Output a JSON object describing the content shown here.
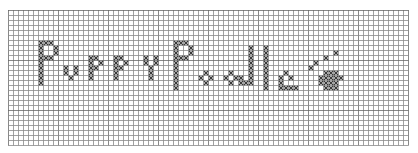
{
  "pattern": {
    "title": "Puppy Puddle",
    "cols": 80,
    "rows": 27,
    "cell_px": 5,
    "grid_color": "#8a8a8a",
    "grid_major_color": "#6a6a6a",
    "stitch_color": "#3a3a3a",
    "stitch_symbol": "x",
    "stitches": [
      [
        6,
        6
      ],
      [
        7,
        6
      ],
      [
        8,
        6
      ],
      [
        9,
        7
      ],
      [
        9,
        8
      ],
      [
        7,
        9
      ],
      [
        8,
        9
      ],
      [
        6,
        7
      ],
      [
        6,
        8
      ],
      [
        6,
        9
      ],
      [
        6,
        10
      ],
      [
        6,
        11
      ],
      [
        6,
        12
      ],
      [
        6,
        13
      ],
      [
        6,
        14
      ],
      [
        11,
        11
      ],
      [
        13,
        11
      ],
      [
        11,
        12
      ],
      [
        13,
        12
      ],
      [
        12,
        13
      ],
      [
        16,
        9
      ],
      [
        17,
        9
      ],
      [
        18,
        10
      ],
      [
        17,
        11
      ],
      [
        16,
        10
      ],
      [
        16,
        11
      ],
      [
        16,
        12
      ],
      [
        16,
        13
      ],
      [
        21,
        9
      ],
      [
        22,
        9
      ],
      [
        23,
        10
      ],
      [
        22,
        11
      ],
      [
        21,
        10
      ],
      [
        21,
        11
      ],
      [
        21,
        12
      ],
      [
        21,
        13
      ],
      [
        27,
        9
      ],
      [
        29,
        9
      ],
      [
        27,
        10
      ],
      [
        29,
        10
      ],
      [
        28,
        11
      ],
      [
        28,
        12
      ],
      [
        28,
        13
      ],
      [
        33,
        6
      ],
      [
        34,
        6
      ],
      [
        35,
        6
      ],
      [
        36,
        7
      ],
      [
        36,
        8
      ],
      [
        34,
        9
      ],
      [
        35,
        9
      ],
      [
        33,
        7
      ],
      [
        33,
        8
      ],
      [
        33,
        9
      ],
      [
        33,
        10
      ],
      [
        33,
        11
      ],
      [
        33,
        12
      ],
      [
        33,
        13
      ],
      [
        33,
        14
      ],
      [
        33,
        15
      ],
      [
        39,
        12
      ],
      [
        38,
        13
      ],
      [
        40,
        13
      ],
      [
        39,
        14
      ],
      [
        44,
        12
      ],
      [
        43,
        13
      ],
      [
        45,
        13
      ],
      [
        44,
        14
      ],
      [
        46,
        14
      ],
      [
        48,
        7
      ],
      [
        48,
        8
      ],
      [
        48,
        9
      ],
      [
        48,
        10
      ],
      [
        48,
        11
      ],
      [
        48,
        12
      ],
      [
        48,
        13
      ],
      [
        48,
        14
      ],
      [
        47,
        14
      ],
      [
        46,
        13
      ],
      [
        51,
        7
      ],
      [
        51,
        8
      ],
      [
        51,
        9
      ],
      [
        51,
        10
      ],
      [
        51,
        11
      ],
      [
        51,
        12
      ],
      [
        51,
        13
      ],
      [
        51,
        14
      ],
      [
        51,
        15
      ],
      [
        55,
        12
      ],
      [
        54,
        13
      ],
      [
        56,
        13
      ],
      [
        54,
        14
      ],
      [
        54,
        15
      ],
      [
        55,
        15
      ],
      [
        56,
        15
      ],
      [
        57,
        15
      ],
      [
        63,
        9
      ],
      [
        61,
        10
      ],
      [
        65,
        8
      ],
      [
        60,
        11
      ],
      [
        63,
        12
      ],
      [
        64,
        12
      ],
      [
        65,
        12
      ],
      [
        62,
        13
      ],
      [
        63,
        13
      ],
      [
        64,
        13
      ],
      [
        65,
        13
      ],
      [
        66,
        13
      ],
      [
        62,
        14
      ],
      [
        63,
        14
      ],
      [
        64,
        14
      ],
      [
        65,
        14
      ],
      [
        63,
        15
      ],
      [
        64,
        15
      ],
      [
        65,
        15
      ]
    ]
  }
}
